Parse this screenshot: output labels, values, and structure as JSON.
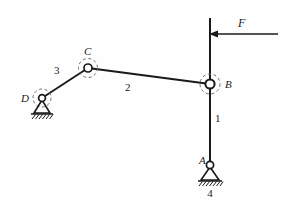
{
  "figure": {
    "type": "kinematic-linkage-diagram",
    "background_color": "#fefefe",
    "stroke_color": "#1a1a1a",
    "width": 283,
    "height": 205
  },
  "joints": [
    {
      "id": "A",
      "label": "A",
      "kind": "fixed-pin-support",
      "x": 210,
      "y": 165,
      "label_x": 199,
      "label_y": 164
    },
    {
      "id": "B",
      "label": "B",
      "kind": "revolute-pin",
      "x": 210,
      "y": 84,
      "label_x": 225,
      "label_y": 87
    },
    {
      "id": "C",
      "label": "C",
      "kind": "revolute-pin",
      "x": 88,
      "y": 68,
      "label_x": 85,
      "label_y": 56
    },
    {
      "id": "D",
      "label": "D",
      "kind": "fixed-pin-support",
      "x": 42,
      "y": 98,
      "label_x": 22,
      "label_y": 101
    }
  ],
  "links": [
    {
      "id": "1",
      "label": "1",
      "description": "vertical bar from A through B to top",
      "label_x": 216,
      "label_y": 122
    },
    {
      "id": "2",
      "label": "2",
      "description": "connecting rod from C to B",
      "label_x": 126,
      "label_y": 89
    },
    {
      "id": "3",
      "label": "3",
      "description": "crank from D to C",
      "label_x": 56,
      "label_y": 73
    },
    {
      "id": "4",
      "label": "4",
      "description": "ground / frame",
      "label_x": 210,
      "label_y": 196
    }
  ],
  "force": {
    "label": "F",
    "direction": "left",
    "label_x": 241,
    "label_y": 26,
    "tail_x": 278,
    "tip_x": 211,
    "y": 34
  }
}
